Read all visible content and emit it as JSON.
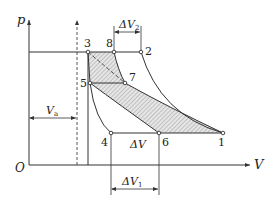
{
  "axes": {
    "y_label": "p",
    "x_label": "V",
    "origin_label": "O"
  },
  "points": [
    {
      "id": "1",
      "label": "1"
    },
    {
      "id": "2",
      "label": "2"
    },
    {
      "id": "3",
      "label": "3"
    },
    {
      "id": "4",
      "label": "4"
    },
    {
      "id": "5",
      "label": "5"
    },
    {
      "id": "6",
      "label": "6"
    },
    {
      "id": "7",
      "label": "7"
    },
    {
      "id": "8",
      "label": "8"
    }
  ],
  "dimensions": {
    "dV2": {
      "main": "ΔV",
      "sub": "2"
    },
    "dV1": {
      "main": "ΔV",
      "sub": "1"
    },
    "dV": {
      "main": "ΔV"
    },
    "Va": {
      "main": "V",
      "sub": "a"
    }
  },
  "colors": {
    "line": "#333333",
    "hatch": "#9a9a9a"
  }
}
